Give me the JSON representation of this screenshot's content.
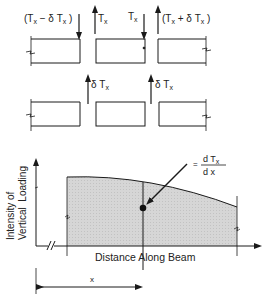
{
  "top_row": {
    "labels": {
      "left_force": "(T",
      "left_force_full": "(Tx − δ Tx )",
      "left_force_parts": [
        "(T",
        "x",
        " − δ T",
        "x",
        " )"
      ],
      "up_left": [
        "T",
        "x"
      ],
      "down_right": [
        "T",
        "x"
      ],
      "right_force_parts": [
        "(T",
        "x",
        " + δ T",
        "x",
        " )"
      ]
    }
  },
  "second_row": {
    "labels": {
      "delta_left": [
        "δ T",
        "x"
      ],
      "delta_right": [
        "δ T",
        "x"
      ]
    }
  },
  "chart": {
    "y_axis_label_line1": "Intensity of",
    "y_axis_label_line2": "Vertical  Loading",
    "x_axis_label": "Distance Along Beam",
    "annotation_eq": "=",
    "annotation_num": [
      "d T",
      "x"
    ],
    "annotation_den": "d x",
    "dimension_label": "x"
  },
  "colors": {
    "ink": "#1a1a1a",
    "fill": "#d4d4d4",
    "background": "#ffffff"
  }
}
